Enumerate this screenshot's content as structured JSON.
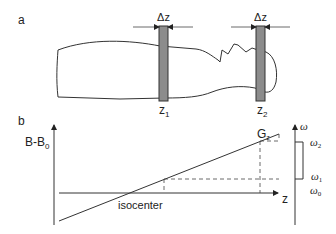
{
  "panel_a": {
    "label": "a",
    "slice_width_label": "Δz",
    "slice1_label_main": "z",
    "slice1_label_sub": "1",
    "slice2_label_main": "z",
    "slice2_label_sub": "2",
    "slice_fill_color": "#8c8c8c"
  },
  "panel_b": {
    "label": "b",
    "y_axis_label_main": "B-B",
    "y_axis_label_sub": "0",
    "x_axis_label": "z",
    "gradient_label_main": "G",
    "gradient_label_sub": "z",
    "isocenter_label": "isocenter",
    "omega_axis_label": "ω",
    "omega_levels": [
      {
        "main": "ω",
        "sub": "2"
      },
      {
        "main": "ω",
        "sub": "1"
      },
      {
        "main": "ω",
        "sub": "0"
      }
    ]
  }
}
